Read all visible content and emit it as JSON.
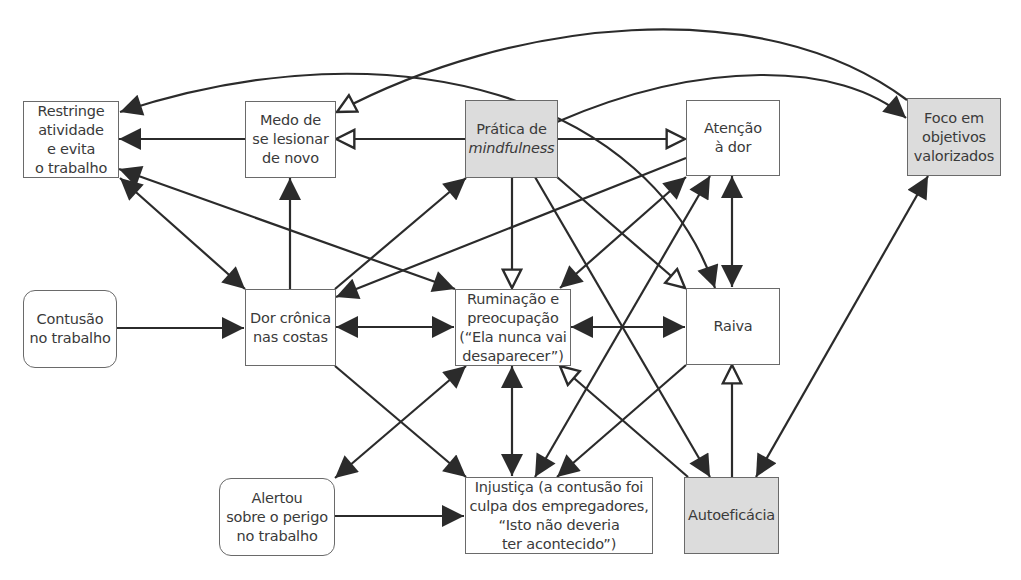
{
  "diagram": {
    "title": "",
    "colors": {
      "line": "#2b2b2b",
      "node_border": "#6a6a6a",
      "node_fill": "#ffffff",
      "highlight_fill": "#dcdcdc",
      "text": "#3a3a3a"
    },
    "nodes": {
      "restringe": {
        "label": "Restringe\natividade\ne evita\no trabalho",
        "style": "plain"
      },
      "medo": {
        "label": "Medo de\nse lesionar\nde novo",
        "style": "plain"
      },
      "pratica": {
        "label_line1": "Prática de",
        "label_line2": "mindfulness",
        "style": "highlight"
      },
      "atencao": {
        "label": "Atenção\nà dor",
        "style": "plain"
      },
      "foco": {
        "label": "Foco em\nobjetivos\nvalorizados",
        "style": "highlight"
      },
      "contusao": {
        "label": "Contusão\nno trabalho",
        "style": "rounded"
      },
      "dor": {
        "label": "Dor crônica\nnas costas",
        "style": "plain"
      },
      "ruminacao": {
        "label": "Ruminação e\npreocupação\n(“Ela nunca vai\ndesaparecer”)",
        "style": "plain"
      },
      "raiva": {
        "label": "Raiva",
        "style": "plain"
      },
      "alertou": {
        "label": "Alertou\nsobre o perigo\nno trabalho",
        "style": "rounded"
      },
      "injustica": {
        "label": "Injustiça (a contusão foi\nculpa dos empregadores,\n“Isto não deveria\nter acontecido”)",
        "style": "plain"
      },
      "autoeficacia": {
        "label": "Autoeficácia",
        "style": "highlight"
      }
    },
    "edges": [
      {
        "from": "medo",
        "to": "restringe",
        "type": "solid"
      },
      {
        "from": "dor",
        "to": "medo",
        "type": "solid"
      },
      {
        "from": "contusao",
        "to": "dor",
        "type": "solid"
      },
      {
        "from": "alertou",
        "to": "injustica",
        "type": "solid"
      },
      {
        "from": "dor",
        "to": "restringe",
        "type": "bidirectional"
      },
      {
        "from": "dor",
        "to": "ruminacao",
        "type": "bidirectional"
      },
      {
        "from": "dor",
        "to": "pratica",
        "type": "solid"
      },
      {
        "from": "dor",
        "to": "injustica",
        "type": "solid"
      },
      {
        "from": "restringe",
        "to": "ruminacao",
        "type": "bidirectional"
      },
      {
        "from": "atencao",
        "to": "dor",
        "type": "solid"
      },
      {
        "from": "pratica",
        "to": "medo",
        "type": "inhibitory"
      },
      {
        "from": "pratica",
        "to": "atencao",
        "type": "inhibitory"
      },
      {
        "from": "pratica",
        "to": "ruminacao",
        "type": "inhibitory"
      },
      {
        "from": "pratica",
        "to": "raiva",
        "type": "inhibitory"
      },
      {
        "from": "pratica",
        "to": "autoeficacia",
        "type": "solid"
      },
      {
        "from": "pratica",
        "to": "foco",
        "type": "solid"
      },
      {
        "from": "foco",
        "to": "medo",
        "type": "inhibitory"
      },
      {
        "from": "foco",
        "to": "autoeficacia",
        "type": "bidirectional"
      },
      {
        "from": "restringe",
        "to": "raiva",
        "type": "curved"
      },
      {
        "from": "atencao",
        "to": "ruminacao",
        "type": "bidirectional"
      },
      {
        "from": "atencao",
        "to": "raiva",
        "type": "bidirectional"
      },
      {
        "from": "injustica",
        "to": "atencao",
        "type": "bidirectional"
      },
      {
        "from": "ruminacao",
        "to": "raiva",
        "type": "bidirectional"
      },
      {
        "from": "ruminacao",
        "to": "injustica",
        "type": "bidirectional"
      },
      {
        "from": "ruminacao",
        "to": "alertou",
        "type": "bidirectional"
      },
      {
        "from": "raiva",
        "to": "injustica",
        "type": "solid"
      },
      {
        "from": "autoeficacia",
        "to": "ruminacao",
        "type": "inhibitory"
      },
      {
        "from": "autoeficacia",
        "to": "raiva",
        "type": "inhibitory"
      }
    ]
  }
}
